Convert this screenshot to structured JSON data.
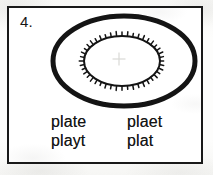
{
  "worksheet": {
    "item_number": "4.",
    "figure": {
      "name": "plate-diagram",
      "description": "thick outer ellipse with serrated inner ellipse",
      "ink_color": "#141414",
      "outer_ellipse": {
        "cx": 115,
        "cy": 53,
        "rx": 71,
        "ry": 45,
        "stroke_width": 5
      },
      "inner_ellipse": {
        "cx": 113,
        "cy": 53,
        "rx": 38,
        "ry": 25,
        "stroke_width": 2,
        "tick_count": 44,
        "tick_length": 3
      },
      "center_crosshair": {
        "cx": 110,
        "cy": 51,
        "size": 13,
        "color": "#d9d9d6"
      }
    },
    "answers": {
      "columns": [
        {
          "words": [
            "plate",
            "playt"
          ]
        },
        {
          "words": [
            "plaet",
            "plat"
          ]
        }
      ]
    }
  }
}
